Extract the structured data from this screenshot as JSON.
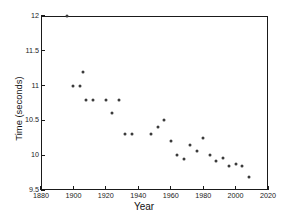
{
  "chart_data": {
    "type": "scatter",
    "title": "",
    "xlabel": "Year",
    "ylabel": "Time (seconds)",
    "xlim": [
      1880,
      2020
    ],
    "ylim": [
      9.5,
      12
    ],
    "xticks": [
      1880,
      1900,
      1920,
      1940,
      1960,
      1980,
      2000,
      2020
    ],
    "yticks": [
      9.5,
      10,
      10.5,
      11,
      11.5,
      12
    ],
    "xtick_labels": [
      "1880",
      "1900",
      "1920",
      "1940",
      "1960",
      "1980",
      "2000",
      "2020"
    ],
    "ytick_labels": [
      "9.5",
      "10",
      "10.5",
      "11",
      "11.5",
      "12"
    ],
    "grid": false,
    "legend": null,
    "marker": "circle",
    "marker_color": "#3b3b3b",
    "x": [
      1896,
      1900,
      1904,
      1906,
      1908,
      1912,
      1920,
      1924,
      1928,
      1932,
      1936,
      1948,
      1952,
      1956,
      1960,
      1964,
      1968,
      1972,
      1976,
      1980,
      1984,
      1988,
      1992,
      1996,
      2000,
      2004,
      2008
    ],
    "values": [
      12.0,
      11.0,
      11.0,
      11.2,
      10.8,
      10.8,
      10.8,
      10.6,
      10.8,
      10.3,
      10.3,
      10.3,
      10.4,
      10.5,
      10.2,
      10.0,
      9.95,
      10.14,
      10.06,
      10.25,
      10.0,
      9.92,
      9.96,
      9.84,
      9.87,
      9.85,
      9.69
    ],
    "points": [
      {
        "x": 1896,
        "y": 12.0
      },
      {
        "x": 1900,
        "y": 11.0
      },
      {
        "x": 1904,
        "y": 11.0
      },
      {
        "x": 1906,
        "y": 11.2
      },
      {
        "x": 1908,
        "y": 10.8
      },
      {
        "x": 1912,
        "y": 10.8
      },
      {
        "x": 1920,
        "y": 10.8
      },
      {
        "x": 1924,
        "y": 10.6
      },
      {
        "x": 1928,
        "y": 10.8
      },
      {
        "x": 1932,
        "y": 10.3
      },
      {
        "x": 1936,
        "y": 10.3
      },
      {
        "x": 1948,
        "y": 10.3
      },
      {
        "x": 1952,
        "y": 10.4
      },
      {
        "x": 1956,
        "y": 10.5
      },
      {
        "x": 1960,
        "y": 10.2
      },
      {
        "x": 1964,
        "y": 10.0
      },
      {
        "x": 1968,
        "y": 9.95
      },
      {
        "x": 1972,
        "y": 10.14
      },
      {
        "x": 1976,
        "y": 10.06
      },
      {
        "x": 1980,
        "y": 10.25
      },
      {
        "x": 1984,
        "y": 10.0
      },
      {
        "x": 1988,
        "y": 9.92
      },
      {
        "x": 1992,
        "y": 9.96
      },
      {
        "x": 1996,
        "y": 9.84
      },
      {
        "x": 2000,
        "y": 9.87
      },
      {
        "x": 2004,
        "y": 9.85
      },
      {
        "x": 2008,
        "y": 9.69
      }
    ]
  },
  "colors": {
    "axis": "#1a1a1a",
    "marker": "#3b3b3b",
    "background": "#ffffff"
  }
}
